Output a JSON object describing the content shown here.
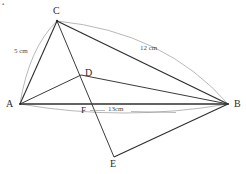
{
  "figure": {
    "corner_artifact": "▪",
    "canvas": {
      "width": 246,
      "height": 174,
      "background": "#ffffff"
    },
    "colors": {
      "solid_line": "#2f2f2f",
      "thin_line": "#4f4f4f",
      "arc_line": "#9a9a9a",
      "label_text": "#2b2b2b",
      "measure_text": "#4a4a4a"
    },
    "points": [
      {
        "id": "A",
        "label": "A",
        "x": 20,
        "y": 104,
        "label_x": 6,
        "label_y": 99
      },
      {
        "id": "B",
        "label": "B",
        "x": 228,
        "y": 104,
        "label_x": 234,
        "label_y": 99
      },
      {
        "id": "C",
        "label": "C",
        "x": 57,
        "y": 21,
        "label_x": 53,
        "label_y": 6
      },
      {
        "id": "D",
        "label": "D",
        "x": 81,
        "y": 75,
        "label_x": 85,
        "label_y": 68
      },
      {
        "id": "F",
        "label": "F",
        "x": 85,
        "y": 110,
        "label_x": 81,
        "label_y": 108
      },
      {
        "id": "E",
        "label": "E",
        "x": 114,
        "y": 157,
        "label_x": 110,
        "label_y": 160
      }
    ],
    "segments": [
      {
        "id": "AC",
        "from": "A",
        "to": "C",
        "style": "solid"
      },
      {
        "id": "CB",
        "from": "C",
        "to": "B",
        "style": "solid"
      },
      {
        "id": "AB",
        "from": "A",
        "to": "B",
        "style": "solid"
      },
      {
        "id": "AD",
        "from": "A",
        "to": "D",
        "style": "solid"
      },
      {
        "id": "DB",
        "from": "D",
        "to": "B",
        "style": "solid"
      },
      {
        "id": "CE",
        "from": "C",
        "to": "E",
        "style": "solid"
      },
      {
        "id": "EB",
        "from": "E",
        "to": "B",
        "style": "solid"
      }
    ],
    "arcs": [
      {
        "id": "arc-AC",
        "from": "A",
        "to": "C",
        "measure": "5 cm"
      },
      {
        "id": "arc-CB",
        "from": "C",
        "to": "B",
        "measure": "12 cm"
      },
      {
        "id": "arc-AB",
        "from": "A",
        "to": "B",
        "measure": "13cm"
      }
    ],
    "measures": [
      {
        "id": "m-AC",
        "text": "5 cm",
        "x": 14,
        "y": 48,
        "for": "AC"
      },
      {
        "id": "m-CB",
        "text": "12 cm",
        "x": 140,
        "y": 47,
        "for": "CB"
      },
      {
        "id": "m-AB",
        "text": "13cm",
        "x": 108,
        "y": 108,
        "for": "AB"
      }
    ]
  }
}
